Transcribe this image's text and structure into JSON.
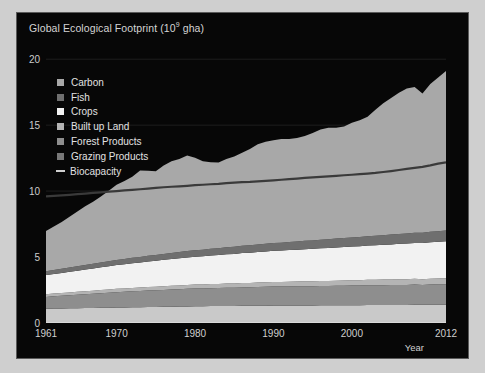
{
  "chart_data": {
    "type": "area",
    "title_main": "Global Ecological Footprint (10",
    "title_sup": "9",
    "title_tail": " gha)",
    "xlabel": "Year",
    "ylabel": "",
    "stacked": true,
    "xlim": [
      1961,
      2012
    ],
    "ylim": [
      0,
      21
    ],
    "yticks": [
      0,
      5,
      10,
      15,
      20
    ],
    "ytick_labels": [
      "0",
      "5",
      "10",
      "15",
      "20"
    ],
    "xticks": [
      1961,
      1970,
      1980,
      1990,
      2000,
      2012
    ],
    "xtick_labels": [
      "1961",
      "1970",
      "1980",
      "1990",
      "2000",
      "2012"
    ],
    "grid": true,
    "legend_position": "upper-left",
    "background": "#070707",
    "x": [
      1961,
      1962,
      1963,
      1964,
      1965,
      1966,
      1967,
      1968,
      1969,
      1970,
      1971,
      1972,
      1973,
      1974,
      1975,
      1976,
      1977,
      1978,
      1979,
      1980,
      1981,
      1982,
      1983,
      1984,
      1985,
      1986,
      1987,
      1988,
      1989,
      1990,
      1991,
      1992,
      1993,
      1994,
      1995,
      1996,
      1997,
      1998,
      1999,
      2000,
      2001,
      2002,
      2003,
      2004,
      2005,
      2006,
      2007,
      2008,
      2009,
      2010,
      2011,
      2012
    ],
    "series": [
      {
        "name": "Grazing Products",
        "color": "#c9c9c9",
        "order_from_bottom": 1,
        "values": [
          1.08,
          1.09,
          1.1,
          1.11,
          1.12,
          1.13,
          1.14,
          1.15,
          1.16,
          1.17,
          1.18,
          1.19,
          1.2,
          1.21,
          1.22,
          1.23,
          1.24,
          1.25,
          1.26,
          1.27,
          1.27,
          1.28,
          1.28,
          1.29,
          1.29,
          1.3,
          1.3,
          1.31,
          1.31,
          1.32,
          1.32,
          1.32,
          1.33,
          1.33,
          1.33,
          1.34,
          1.34,
          1.34,
          1.35,
          1.35,
          1.35,
          1.36,
          1.36,
          1.36,
          1.37,
          1.37,
          1.37,
          1.38,
          1.38,
          1.38,
          1.39,
          1.39
        ]
      },
      {
        "name": "Forest Products",
        "color": "#8e8e8e",
        "order_from_bottom": 2,
        "values": [
          0.9,
          0.93,
          0.96,
          0.99,
          1.02,
          1.05,
          1.08,
          1.11,
          1.14,
          1.17,
          1.19,
          1.21,
          1.23,
          1.25,
          1.26,
          1.28,
          1.3,
          1.31,
          1.33,
          1.34,
          1.35,
          1.36,
          1.37,
          1.38,
          1.39,
          1.4,
          1.41,
          1.42,
          1.43,
          1.44,
          1.44,
          1.45,
          1.45,
          1.46,
          1.46,
          1.47,
          1.47,
          1.48,
          1.48,
          1.49,
          1.49,
          1.5,
          1.5,
          1.51,
          1.51,
          1.52,
          1.52,
          1.53,
          1.5,
          1.53,
          1.54,
          1.55
        ]
      },
      {
        "name": "Built up Land",
        "color": "#b4b4b4",
        "order_from_bottom": 3,
        "values": [
          0.2,
          0.21,
          0.21,
          0.22,
          0.22,
          0.23,
          0.23,
          0.24,
          0.24,
          0.25,
          0.25,
          0.26,
          0.26,
          0.27,
          0.27,
          0.28,
          0.28,
          0.29,
          0.29,
          0.3,
          0.3,
          0.31,
          0.31,
          0.32,
          0.32,
          0.33,
          0.33,
          0.34,
          0.34,
          0.35,
          0.35,
          0.36,
          0.36,
          0.37,
          0.37,
          0.38,
          0.38,
          0.39,
          0.39,
          0.4,
          0.4,
          0.41,
          0.41,
          0.42,
          0.42,
          0.43,
          0.43,
          0.44,
          0.44,
          0.45,
          0.45,
          0.46
        ]
      },
      {
        "name": "Crops",
        "color": "#f2f2f2",
        "order_from_bottom": 4,
        "values": [
          1.45,
          1.48,
          1.52,
          1.56,
          1.6,
          1.64,
          1.68,
          1.72,
          1.76,
          1.8,
          1.84,
          1.87,
          1.9,
          1.94,
          1.97,
          2.0,
          2.03,
          2.06,
          2.09,
          2.12,
          2.14,
          2.17,
          2.19,
          2.22,
          2.24,
          2.27,
          2.29,
          2.31,
          2.34,
          2.36,
          2.38,
          2.4,
          2.42,
          2.44,
          2.46,
          2.48,
          2.5,
          2.52,
          2.54,
          2.56,
          2.58,
          2.6,
          2.62,
          2.64,
          2.66,
          2.68,
          2.7,
          2.72,
          2.74,
          2.76,
          2.78,
          2.8
        ]
      },
      {
        "name": "Fish",
        "color": "#6f6f6f",
        "order_from_bottom": 5,
        "values": [
          0.3,
          0.31,
          0.32,
          0.33,
          0.34,
          0.35,
          0.36,
          0.37,
          0.38,
          0.39,
          0.4,
          0.41,
          0.42,
          0.43,
          0.44,
          0.45,
          0.46,
          0.47,
          0.48,
          0.49,
          0.5,
          0.51,
          0.52,
          0.53,
          0.54,
          0.55,
          0.56,
          0.57,
          0.58,
          0.59,
          0.6,
          0.61,
          0.62,
          0.63,
          0.64,
          0.65,
          0.66,
          0.67,
          0.68,
          0.69,
          0.7,
          0.71,
          0.72,
          0.73,
          0.74,
          0.75,
          0.76,
          0.77,
          0.78,
          0.79,
          0.8,
          0.81
        ]
      },
      {
        "name": "Carbon",
        "color": "#a8a8a8",
        "order_from_bottom": 6,
        "values": [
          3.05,
          3.3,
          3.55,
          3.85,
          4.15,
          4.45,
          4.7,
          5.0,
          5.35,
          5.7,
          5.9,
          6.15,
          6.55,
          6.45,
          6.35,
          6.7,
          6.95,
          7.05,
          7.25,
          7.0,
          6.7,
          6.55,
          6.5,
          6.7,
          6.85,
          7.05,
          7.3,
          7.6,
          7.75,
          7.8,
          7.85,
          7.8,
          7.85,
          7.95,
          8.15,
          8.35,
          8.45,
          8.4,
          8.45,
          8.7,
          8.85,
          9.05,
          9.55,
          10.0,
          10.35,
          10.7,
          11.0,
          11.05,
          10.55,
          11.2,
          11.65,
          12.1
        ]
      }
    ],
    "line_series": {
      "name": "Biocapacity",
      "color": "#3a3a3a",
      "values": [
        9.6,
        9.64,
        9.68,
        9.72,
        9.77,
        9.81,
        9.86,
        9.91,
        9.96,
        10.0,
        10.05,
        10.09,
        10.14,
        10.19,
        10.24,
        10.29,
        10.33,
        10.36,
        10.4,
        10.45,
        10.48,
        10.52,
        10.55,
        10.6,
        10.64,
        10.68,
        10.7,
        10.74,
        10.78,
        10.82,
        10.86,
        10.9,
        10.95,
        11.0,
        11.04,
        11.08,
        11.12,
        11.16,
        11.2,
        11.24,
        11.28,
        11.33,
        11.38,
        11.45,
        11.52,
        11.6,
        11.68,
        11.76,
        11.84,
        11.95,
        12.08,
        12.18
      ]
    },
    "legend": [
      {
        "label": "Carbon",
        "color": "#a8a8a8",
        "marker": "square"
      },
      {
        "label": "Fish",
        "color": "#6f6f6f",
        "marker": "square"
      },
      {
        "label": "Crops",
        "color": "#f2f2f2",
        "marker": "square"
      },
      {
        "label": "Built up Land",
        "color": "#b4b4b4",
        "marker": "square"
      },
      {
        "label": "Forest Products",
        "color": "#8e8e8e",
        "marker": "square"
      },
      {
        "label": "Grazing Products",
        "color": "#787878",
        "marker": "square"
      },
      {
        "label": "Biocapacity",
        "color": "#d0d0d0",
        "marker": "line"
      }
    ]
  }
}
